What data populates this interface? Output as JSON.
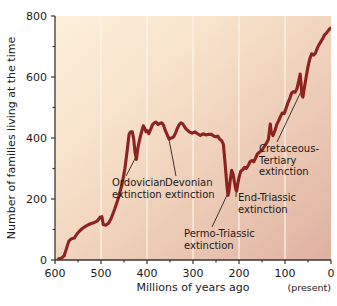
{
  "chart_data": {
    "type": "line",
    "title": "",
    "xlabel": "Millions of years ago",
    "ylabel": "Number of families living at the time",
    "xlim": [
      600,
      0
    ],
    "ylim": [
      0,
      800
    ],
    "x_ticks": [
      600,
      500,
      400,
      300,
      200,
      100,
      0
    ],
    "x_tick_labels": [
      "600",
      "500",
      "400",
      "300",
      "200",
      "100",
      "0"
    ],
    "x_minor_ticks": [
      550,
      450,
      350,
      250,
      150,
      50
    ],
    "y_ticks": [
      0,
      200,
      400,
      600,
      800
    ],
    "y_tick_labels": [
      "0",
      "200",
      "400",
      "600",
      "800"
    ],
    "y_minor_ticks": [
      100,
      300,
      500,
      700
    ],
    "grid": "vertical-only",
    "legend": "none",
    "x_axis_end_note": "(present)",
    "series": [
      {
        "name": "Number of families living at the time",
        "color": "#8d2220",
        "points": [
          [
            592,
            4
          ],
          [
            586,
            6
          ],
          [
            580,
            14
          ],
          [
            575,
            38
          ],
          [
            570,
            62
          ],
          [
            564,
            70
          ],
          [
            558,
            72
          ],
          [
            552,
            86
          ],
          [
            546,
            96
          ],
          [
            540,
            104
          ],
          [
            532,
            112
          ],
          [
            524,
            118
          ],
          [
            516,
            122
          ],
          [
            508,
            128
          ],
          [
            502,
            140
          ],
          [
            498,
            142
          ],
          [
            495,
            116
          ],
          [
            490,
            114
          ],
          [
            484,
            120
          ],
          [
            478,
            136
          ],
          [
            470,
            168
          ],
          [
            462,
            204
          ],
          [
            454,
            250
          ],
          [
            448,
            300
          ],
          [
            443,
            360
          ],
          [
            439,
            412
          ],
          [
            436,
            420
          ],
          [
            432,
            420
          ],
          [
            429,
            398
          ],
          [
            426,
            352
          ],
          [
            423,
            330
          ],
          [
            420,
            366
          ],
          [
            417,
            388
          ],
          [
            414,
            408
          ],
          [
            411,
            424
          ],
          [
            408,
            440
          ],
          [
            405,
            432
          ],
          [
            402,
            420
          ],
          [
            399,
            424
          ],
          [
            396,
            414
          ],
          [
            392,
            428
          ],
          [
            388,
            444
          ],
          [
            384,
            450
          ],
          [
            380,
            452
          ],
          [
            376,
            444
          ],
          [
            372,
            448
          ],
          [
            368,
            450
          ],
          [
            364,
            442
          ],
          [
            360,
            424
          ],
          [
            356,
            410
          ],
          [
            352,
            396
          ],
          [
            349,
            400
          ],
          [
            346,
            400
          ],
          [
            342,
            404
          ],
          [
            338,
            416
          ],
          [
            334,
            432
          ],
          [
            330,
            444
          ],
          [
            326,
            450
          ],
          [
            322,
            446
          ],
          [
            318,
            436
          ],
          [
            314,
            428
          ],
          [
            308,
            420
          ],
          [
            302,
            416
          ],
          [
            296,
            420
          ],
          [
            290,
            414
          ],
          [
            284,
            408
          ],
          [
            278,
            414
          ],
          [
            272,
            410
          ],
          [
            266,
            412
          ],
          [
            260,
            412
          ],
          [
            254,
            406
          ],
          [
            250,
            404
          ],
          [
            246,
            406
          ],
          [
            242,
            396
          ],
          [
            238,
            392
          ],
          [
            234,
            380
          ],
          [
            231,
            330
          ],
          [
            228,
            276
          ],
          [
            226,
            240
          ],
          [
            224,
            212
          ],
          [
            222,
            224
          ],
          [
            219,
            262
          ],
          [
            216,
            294
          ],
          [
            213,
            282
          ],
          [
            210,
            256
          ],
          [
            207,
            232
          ],
          [
            205,
            226
          ],
          [
            203,
            246
          ],
          [
            200,
            270
          ],
          [
            196,
            292
          ],
          [
            192,
            296
          ],
          [
            188,
            304
          ],
          [
            184,
            300
          ],
          [
            180,
            310
          ],
          [
            176,
            322
          ],
          [
            172,
            326
          ],
          [
            168,
            322
          ],
          [
            164,
            334
          ],
          [
            160,
            348
          ],
          [
            155,
            354
          ],
          [
            150,
            360
          ],
          [
            145,
            372
          ],
          [
            140,
            384
          ],
          [
            136,
            396
          ],
          [
            132,
            446
          ],
          [
            130,
            420
          ],
          [
            126,
            408
          ],
          [
            122,
            424
          ],
          [
            118,
            444
          ],
          [
            114,
            456
          ],
          [
            110,
            470
          ],
          [
            106,
            482
          ],
          [
            102,
            480
          ],
          [
            98,
            496
          ],
          [
            94,
            514
          ],
          [
            90,
            528
          ],
          [
            86,
            546
          ],
          [
            82,
            552
          ],
          [
            78,
            550
          ],
          [
            74,
            562
          ],
          [
            70,
            588
          ],
          [
            67,
            610
          ],
          [
            65,
            576
          ],
          [
            63,
            540
          ],
          [
            61,
            534
          ],
          [
            58,
            564
          ],
          [
            54,
            600
          ],
          [
            50,
            634
          ],
          [
            46,
            660
          ],
          [
            42,
            676
          ],
          [
            38,
            672
          ],
          [
            34,
            678
          ],
          [
            30,
            694
          ],
          [
            26,
            706
          ],
          [
            22,
            716
          ],
          [
            18,
            726
          ],
          [
            14,
            738
          ],
          [
            10,
            744
          ],
          [
            6,
            752
          ],
          [
            3,
            758
          ],
          [
            1,
            760
          ]
        ]
      }
    ],
    "annotations": [
      {
        "id": "ordovician",
        "lines": [
          "Ordovician",
          "extinction"
        ],
        "target_x": 424,
        "target_y": 338
      },
      {
        "id": "devonian",
        "lines": [
          "Devonian",
          "extinction"
        ],
        "target_x": 352,
        "target_y": 394
      },
      {
        "id": "permo-triassic",
        "lines": [
          "Permo-Triassic",
          "extinction"
        ],
        "target_x": 225,
        "target_y": 216
      },
      {
        "id": "end-triassic",
        "lines": [
          "End-Triassic",
          "extinction"
        ],
        "target_x": 206,
        "target_y": 228
      },
      {
        "id": "cretaceous-tertiary",
        "lines": [
          "Cretaceous-",
          "Tertiary",
          "extinction"
        ],
        "target_x": 64,
        "target_y": 556
      }
    ],
    "colors": {
      "line": "#8d2220",
      "plot_bg_top_left": "#fbedd7",
      "plot_bg_bottom_right": "#e0b3a6",
      "gridline": "#fdf6e9",
      "axis": "#3c3532",
      "text": "#1a1a1a"
    }
  }
}
